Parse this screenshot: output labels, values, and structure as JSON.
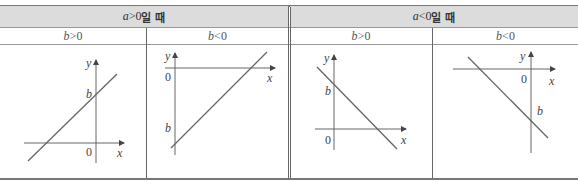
{
  "table": {
    "header": [
      {
        "cond": "a",
        "op": ">0",
        "suffix": "일 때"
      },
      {
        "cond": "a",
        "op": "<0",
        "suffix": "일 때"
      }
    ],
    "subheader": [
      {
        "var": "b",
        "op": ">0"
      },
      {
        "var": "b",
        "op": "<0"
      },
      {
        "var": "b",
        "op": ">0"
      },
      {
        "var": "b",
        "op": "<0"
      }
    ],
    "graphs": [
      {
        "case": "a>0, b>0",
        "x_label": "x",
        "y_label": "y",
        "origin_label": "0",
        "intercept_label": "b",
        "slope": "positive",
        "intercept": "above origin"
      },
      {
        "case": "a>0, b<0",
        "x_label": "x",
        "y_label": "y",
        "origin_label": "0",
        "intercept_label": "b",
        "slope": "positive",
        "intercept": "below origin"
      },
      {
        "case": "a<0, b>0",
        "x_label": "x",
        "y_label": "y",
        "origin_label": "0",
        "intercept_label": "b",
        "slope": "negative",
        "intercept": "above origin"
      },
      {
        "case": "a<0, b<0",
        "x_label": "x",
        "y_label": "y",
        "origin_label": "0",
        "intercept_label": "b",
        "slope": "negative",
        "intercept": "below origin"
      }
    ]
  },
  "colors": {
    "header_bg": "#dcdcdc",
    "line": "#555555",
    "border": "#777777"
  }
}
